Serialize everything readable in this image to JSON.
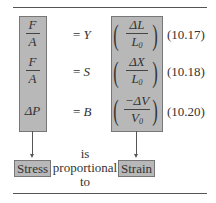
{
  "equations": [
    {
      "lhs_num": "F",
      "lhs_den": "A",
      "rhs": "= Y",
      "rhs_const": "Y",
      "strain_num": "ΔL",
      "strain_den": "L",
      "strain_den_sub": "0",
      "number": "(10.17)"
    },
    {
      "lhs_num": "F",
      "lhs_den": "A",
      "rhs": "= S",
      "rhs_const": "S",
      "strain_num": "ΔX",
      "strain_den": "L",
      "strain_den_sub": "0",
      "number": "(10.18)"
    },
    {
      "lhs": "ΔP",
      "rhs": "= B",
      "rhs_const": "B",
      "strain_num": "−ΔV",
      "strain_den": "V",
      "strain_den_sub": "0",
      "number": "(10.20)"
    }
  ],
  "labels": {
    "stress": "Stress",
    "strain": "Strain",
    "relation_line1": "is",
    "relation_line2": "proportional",
    "relation_line3": "to"
  },
  "colors": {
    "box_fill": "#b8b8b8",
    "box_border": "#777777",
    "rule": "#555555"
  }
}
